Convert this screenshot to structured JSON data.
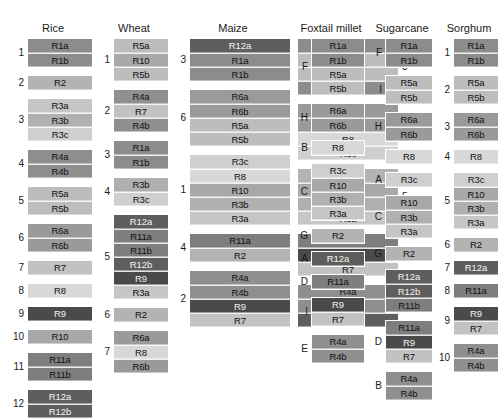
{
  "figure": {
    "type": "comparative-genomics-synteny-blocks",
    "block_colors": {
      "R1a": "#8c8c8c",
      "R1b": "#8c8c8c",
      "R2": "#b3b3b3",
      "R3a": "#c6c6c6",
      "R3b": "#b0b0b0",
      "R3c": "#cfcfcf",
      "R4a": "#8f8f8f",
      "R4b": "#8f8f8f",
      "R5a": "#bdbdbd",
      "R5b": "#bdbdbd",
      "R6a": "#9a9a9a",
      "R6b": "#9a9a9a",
      "R7": "#c2c2c2",
      "R8": "#d8d8d8",
      "R9": "#4a4a4a",
      "R10": "#a8a8a8",
      "R11a": "#7e7e7e",
      "R11b": "#7e7e7e",
      "R12a": "#5e5e5e",
      "R12b": "#5e5e5e"
    },
    "dark_text_blocks": [
      "R9",
      "R12a",
      "R12b"
    ],
    "columns": [
      {
        "name": "Rice",
        "x": 10,
        "width": 86,
        "label_side": "left",
        "subcolumns": [
          {
            "groups": [
              {
                "label": "1",
                "blocks": [
                  "R1a",
                  "R1b"
                ]
              },
              {
                "label": "2",
                "blocks": [
                  "R2"
                ]
              },
              {
                "label": "3",
                "blocks": [
                  "R3a",
                  "R3b",
                  "R3c"
                ]
              },
              {
                "label": "4",
                "blocks": [
                  "R4a",
                  "R4b"
                ]
              },
              {
                "label": "5",
                "blocks": [
                  "R5a",
                  "R5b"
                ]
              },
              {
                "label": "6",
                "blocks": [
                  "R6a",
                  "R6b"
                ]
              },
              {
                "label": "7",
                "blocks": [
                  "R7"
                ]
              },
              {
                "label": "8",
                "blocks": [
                  "R8"
                ]
              },
              {
                "label": "9",
                "blocks": [
                  "R9"
                ]
              },
              {
                "label": "10",
                "blocks": [
                  "R10"
                ]
              },
              {
                "label": "11",
                "blocks": [
                  "R11a",
                  "R11b"
                ]
              },
              {
                "label": "12",
                "blocks": [
                  "R12a",
                  "R12b"
                ]
              }
            ]
          }
        ]
      },
      {
        "name": "Wheat",
        "x": 96,
        "width": 76,
        "label_side": "left",
        "subcolumns": [
          {
            "groups": [
              {
                "label": "1",
                "blocks": [
                  "R5a",
                  "R10",
                  "R5b"
                ]
              },
              {
                "label": "2",
                "blocks": [
                  "R4a",
                  "R7",
                  "R4b"
                ]
              },
              {
                "label": "3",
                "blocks": [
                  "R1a",
                  "R1b"
                ]
              },
              {
                "label": "4",
                "blocks": [
                  "R3b",
                  "R3c"
                ]
              },
              {
                "label": "5",
                "blocks": [
                  "R12a",
                  "R11a",
                  "R11b",
                  "R12b",
                  "R9",
                  "R3a"
                ]
              },
              {
                "label": "6",
                "blocks": [
                  "R2"
                ]
              },
              {
                "label": "7",
                "blocks": [
                  "R6a",
                  "R8",
                  "R6b"
                ]
              }
            ]
          }
        ]
      },
      {
        "name": "Maize",
        "x": 172,
        "width": 122,
        "label_side": "split",
        "subcolumns": [
          {
            "label_side": "left",
            "groups": [
              {
                "label": "3",
                "blocks": [
                  "R12a",
                  "R1a",
                  "R1b"
                ]
              },
              {
                "label": "6",
                "blocks": [
                  "R6a",
                  "R6b",
                  "R5a",
                  "R5b"
                ]
              },
              {
                "label": "1",
                "blocks": [
                  "R3c",
                  "R8",
                  "R10",
                  "R3b",
                  "R3a"
                ]
              },
              {
                "label": "4",
                "blocks": [
                  "R11a",
                  "R2"
                ]
              },
              {
                "label": "2",
                "blocks": [
                  "R4a",
                  "R4b",
                  "R9",
                  "R7"
                ]
              }
            ]
          },
          {
            "label_side": "right",
            "groups": [
              {
                "label": "8",
                "blocks": [
                  "R1a",
                  "R5a",
                  "R5b",
                  "R1b"
                ]
              },
              {
                "label": "9",
                "blocks": [
                  "R6a",
                  "R6b",
                  "R8",
                  "R3c"
                ]
              },
              {
                "label": "5",
                "blocks": [
                  "R2",
                  "R10",
                  "R3b",
                  "R3a"
                ]
              },
              {
                "label": "7",
                "blocks": [
                  "R11a",
                  "R9",
                  "R7"
                ]
              },
              {
                "label": "10",
                "blocks": [
                  "R4a",
                  "R4b",
                  "R12a"
                ]
              }
            ]
          }
        ]
      },
      {
        "name": "Foxtail millet",
        "x": 294,
        "width": 74,
        "label_side": "left",
        "subcolumns": [
          {
            "groups": [
              {
                "label": "F",
                "blocks": [
                  "R1a",
                  "R1b",
                  "R5a",
                  "R5b"
                ]
              },
              {
                "label": "H",
                "blocks": [
                  "R6a",
                  "R6b"
                ]
              },
              {
                "label": "B",
                "blocks": [
                  "R8"
                ]
              },
              {
                "label": "C",
                "blocks": [
                  "R3c",
                  "R10",
                  "R3b",
                  "R3a"
                ]
              },
              {
                "label": "G",
                "blocks": [
                  "R2"
                ]
              },
              {
                "label": "A",
                "blocks": [
                  "R12a"
                ]
              },
              {
                "label": "D",
                "blocks": [
                  "R11a"
                ]
              },
              {
                "label": "I",
                "blocks": [
                  "R9",
                  "R7"
                ]
              },
              {
                "label": "E",
                "blocks": [
                  "R4a",
                  "R4b"
                ]
              }
            ]
          }
        ]
      },
      {
        "name": "Sugarcane",
        "x": 368,
        "width": 68,
        "label_side": "left",
        "subcolumns": [
          {
            "groups": [
              {
                "label": "F",
                "blocks": [
                  "R1a",
                  "R1b"
                ]
              },
              {
                "label": "I",
                "blocks": [
                  "R5a",
                  "R5b"
                ]
              },
              {
                "label": "H",
                "blocks": [
                  "R6a",
                  "R6b"
                ]
              },
              {
                "label": "",
                "blocks": [
                  "R8"
                ]
              },
              {
                "label": "A",
                "blocks": [
                  "R3c"
                ]
              },
              {
                "label": "C",
                "blocks": [
                  "R10",
                  "R3b",
                  "R3a"
                ]
              },
              {
                "label": "G",
                "blocks": [
                  "R2"
                ]
              },
              {
                "label": "",
                "blocks": [
                  "R12a",
                  "R12b",
                  "R11b"
                ]
              },
              {
                "label": "D",
                "blocks": [
                  "R11a",
                  "R9",
                  "R7"
                ]
              },
              {
                "label": "B",
                "blocks": [
                  "R4a",
                  "R4b"
                ]
              }
            ]
          }
        ]
      },
      {
        "name": "Sorghum",
        "x": 436,
        "width": 66,
        "label_side": "left",
        "subcolumns": [
          {
            "groups": [
              {
                "label": "1",
                "blocks": [
                  "R1a",
                  "R1b"
                ]
              },
              {
                "label": "2",
                "blocks": [
                  "R5a",
                  "R5b"
                ]
              },
              {
                "label": "3",
                "blocks": [
                  "R6a",
                  "R6b"
                ]
              },
              {
                "label": "4",
                "blocks": [
                  "R8"
                ]
              },
              {
                "label": "5",
                "blocks": [
                  "R3c",
                  "R10",
                  "R3b",
                  "R3a"
                ]
              },
              {
                "label": "6",
                "blocks": [
                  "R2"
                ]
              },
              {
                "label": "7",
                "blocks": [
                  "R12a"
                ]
              },
              {
                "label": "8",
                "blocks": [
                  "R11a"
                ]
              },
              {
                "label": "9",
                "blocks": [
                  "R9",
                  "R7"
                ]
              },
              {
                "label": "10",
                "blocks": [
                  "R4a",
                  "R4b"
                ]
              }
            ]
          }
        ]
      }
    ]
  }
}
